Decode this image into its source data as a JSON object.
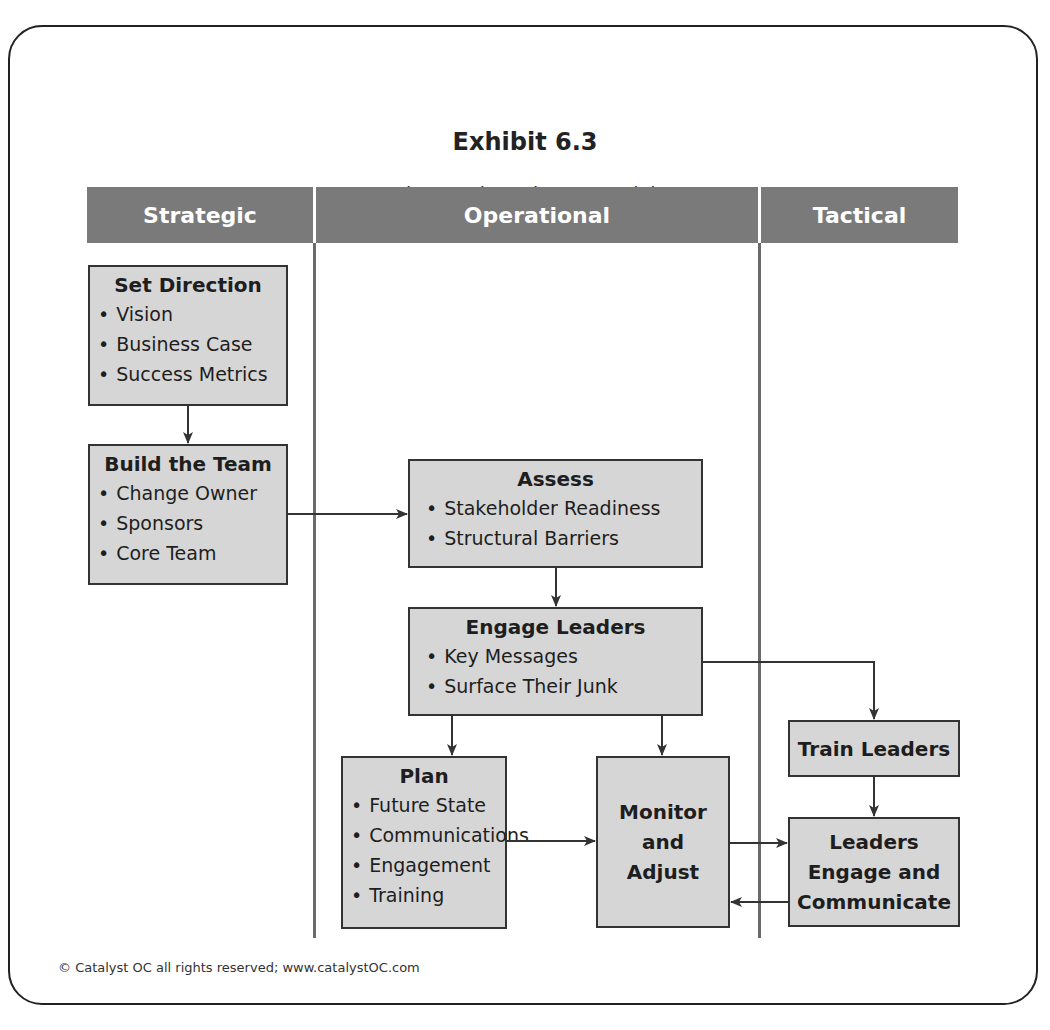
{
  "exhibit": {
    "title": "Exhibit 6.3",
    "subtitle": "The Catalyst Change Model"
  },
  "columns": [
    {
      "label": "Strategic"
    },
    {
      "label": "Operational"
    },
    {
      "label": "Tactical"
    }
  ],
  "boxes": {
    "set_direction": {
      "title": "Set Direction",
      "items": [
        "Vision",
        "Business Case",
        "Success Metrics"
      ]
    },
    "build_team": {
      "title": "Build the Team",
      "items": [
        "Change Owner",
        "Sponsors",
        "Core Team"
      ]
    },
    "assess": {
      "title": "Assess",
      "items": [
        "Stakeholder Readiness",
        "Structural Barriers"
      ]
    },
    "engage_leaders": {
      "title": "Engage Leaders",
      "items": [
        "Key Messages",
        "Surface Their Junk"
      ]
    },
    "plan": {
      "title": "Plan",
      "items": [
        "Future State",
        "Communications",
        "Engagement",
        "Training"
      ]
    },
    "monitor": {
      "line1": "Monitor",
      "line2": "and",
      "line3": "Adjust"
    },
    "train_leaders": {
      "title": "Train Leaders"
    },
    "leaders_engage": {
      "line1": "Leaders",
      "line2": "Engage and",
      "line3": "Communicate"
    }
  },
  "footer": {
    "text": "© Catalyst OC all rights reserved; www.catalystOC.com"
  },
  "colors": {
    "header_bg": "#7a7a7a",
    "box_bg": "#d6d6d6",
    "line": "#333333"
  }
}
